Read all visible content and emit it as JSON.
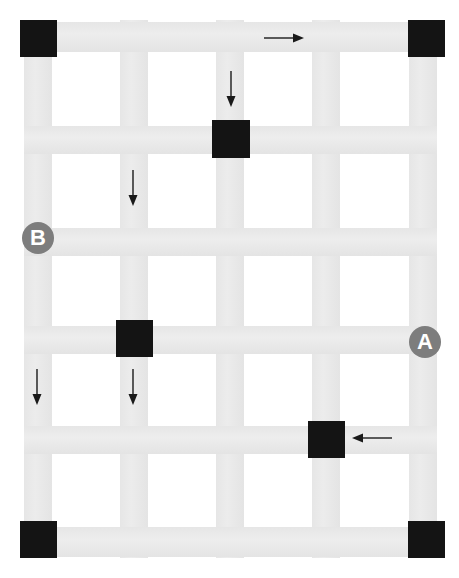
{
  "diagram": {
    "canvas": {
      "width": 459,
      "height": 578,
      "background": "#ffffff"
    },
    "colors": {
      "grid_line": "#e8e8e8",
      "node_fill": "#141414",
      "marker_fill": "#7d7d7d",
      "marker_text": "#ffffff",
      "arrow_stroke": "#1a1a1a"
    },
    "grid": {
      "line_thickness": 28,
      "vertical_lines": [
        {
          "id": "col-1",
          "x": 24
        },
        {
          "id": "col-2",
          "x": 120
        },
        {
          "id": "col-3",
          "x": 216
        },
        {
          "id": "col-4",
          "x": 312
        },
        {
          "id": "col-5",
          "x": 409
        }
      ],
      "horizontal_lines": [
        {
          "id": "row-1",
          "y": 22
        },
        {
          "id": "row-2",
          "y": 126
        },
        {
          "id": "row-3",
          "y": 228
        },
        {
          "id": "row-4",
          "y": 326
        },
        {
          "id": "row-5",
          "y": 426
        },
        {
          "id": "row-6",
          "y": 527
        }
      ]
    },
    "nodes": [
      {
        "id": "node-top-left",
        "label": "",
        "x": 20,
        "y": 20,
        "size": 37
      },
      {
        "id": "node-top-right",
        "label": "",
        "x": 408,
        "y": 20,
        "size": 37
      },
      {
        "id": "node-mid-upper",
        "label": "",
        "x": 212,
        "y": 120,
        "size": 38
      },
      {
        "id": "node-mid-left",
        "label": "",
        "x": 116,
        "y": 320,
        "size": 37
      },
      {
        "id": "node-lower-right",
        "label": "",
        "x": 308,
        "y": 421,
        "size": 37
      },
      {
        "id": "node-bottom-left",
        "label": "",
        "x": 20,
        "y": 521,
        "size": 37
      },
      {
        "id": "node-bottom-right",
        "label": "",
        "x": 408,
        "y": 521,
        "size": 37
      }
    ],
    "markers": [
      {
        "id": "marker-b",
        "label": "B",
        "cx": 38,
        "cy": 238,
        "r": 16
      },
      {
        "id": "marker-a",
        "label": "A",
        "cx": 425,
        "cy": 342,
        "r": 16
      }
    ],
    "arrows": [
      {
        "id": "arrow-right-top",
        "direction": "right",
        "x": 264,
        "y": 38,
        "length": 40
      },
      {
        "id": "arrow-down-col3-top",
        "direction": "down",
        "x": 231,
        "y": 71,
        "length": 35
      },
      {
        "id": "arrow-down-col2-upper",
        "direction": "down",
        "x": 133,
        "y": 170,
        "length": 36
      },
      {
        "id": "arrow-down-col1-lower",
        "direction": "down",
        "x": 37,
        "y": 369,
        "length": 36
      },
      {
        "id": "arrow-down-col2-lower",
        "direction": "down",
        "x": 133,
        "y": 369,
        "length": 36
      },
      {
        "id": "arrow-left-bottom",
        "direction": "left",
        "x": 352,
        "y": 438,
        "length": 40
      }
    ]
  }
}
